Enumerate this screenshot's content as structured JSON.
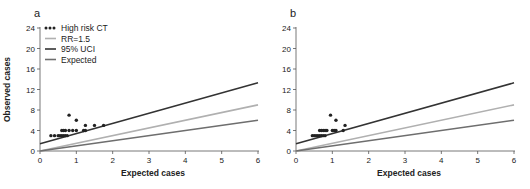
{
  "chart_data": [
    {
      "type": "scatter",
      "panel_label": "a",
      "title": "",
      "xlabel": "Expected cases",
      "ylabel": "Observed cases",
      "xlim": [
        0,
        6
      ],
      "ylim": [
        0,
        24
      ],
      "xticks": [
        0,
        1,
        2,
        3,
        4,
        5,
        6
      ],
      "yticks": [
        0,
        4,
        8,
        12,
        16,
        20,
        24
      ],
      "grid": false,
      "legend_position": "top-left",
      "legend": [
        {
          "label": "High risk CT",
          "style": "dots",
          "color": "#222222"
        },
        {
          "label": "RR=1.5",
          "style": "line",
          "color": "#b0b0b0"
        },
        {
          "label": "95% UCI",
          "style": "line",
          "color": "#333333"
        },
        {
          "label": "Expected",
          "style": "line",
          "color": "#6e6e6e"
        }
      ],
      "series": [
        {
          "name": "High risk CT",
          "type": "scatter",
          "color": "#222222",
          "points": [
            [
              0.3,
              3
            ],
            [
              0.4,
              3
            ],
            [
              0.5,
              3
            ],
            [
              0.55,
              3
            ],
            [
              0.6,
              3
            ],
            [
              0.65,
              3
            ],
            [
              0.7,
              3
            ],
            [
              0.75,
              3
            ],
            [
              0.6,
              4
            ],
            [
              0.65,
              4
            ],
            [
              0.7,
              4
            ],
            [
              0.8,
              4
            ],
            [
              0.9,
              4
            ],
            [
              1.0,
              4
            ],
            [
              1.2,
              4
            ],
            [
              1.25,
              4
            ],
            [
              1.25,
              5
            ],
            [
              1.5,
              5
            ],
            [
              1.75,
              5
            ],
            [
              1.0,
              6
            ],
            [
              0.8,
              7
            ]
          ]
        },
        {
          "name": "RR=1.5",
          "type": "line",
          "color": "#b0b0b0",
          "points": [
            [
              0,
              0
            ],
            [
              6,
              9
            ]
          ]
        },
        {
          "name": "95% UCI",
          "type": "line",
          "color": "#333333",
          "points": [
            [
              0,
              1.4
            ],
            [
              6,
              13.3
            ]
          ]
        },
        {
          "name": "Expected",
          "type": "line",
          "color": "#6e6e6e",
          "points": [
            [
              0,
              0
            ],
            [
              6,
              6
            ]
          ]
        }
      ]
    },
    {
      "type": "scatter",
      "panel_label": "b",
      "title": "",
      "xlabel": "Expected cases",
      "ylabel": "",
      "xlim": [
        0,
        6
      ],
      "ylim": [
        0,
        24
      ],
      "xticks": [
        0,
        1,
        2,
        3,
        4,
        5,
        6
      ],
      "yticks": [
        0,
        4,
        8,
        12,
        16,
        20,
        24
      ],
      "grid": false,
      "series": [
        {
          "name": "High risk CT",
          "type": "scatter",
          "color": "#222222",
          "points": [
            [
              0.45,
              3
            ],
            [
              0.5,
              3
            ],
            [
              0.55,
              3
            ],
            [
              0.6,
              3
            ],
            [
              0.65,
              3
            ],
            [
              0.7,
              3
            ],
            [
              0.75,
              3
            ],
            [
              0.8,
              3
            ],
            [
              0.65,
              4
            ],
            [
              0.7,
              4
            ],
            [
              0.75,
              4
            ],
            [
              0.8,
              4
            ],
            [
              0.85,
              4
            ],
            [
              1.0,
              4
            ],
            [
              1.05,
              4
            ],
            [
              1.1,
              4
            ],
            [
              1.3,
              4
            ],
            [
              1.35,
              5
            ],
            [
              1.1,
              6
            ],
            [
              0.95,
              7
            ]
          ]
        },
        {
          "name": "RR=1.5",
          "type": "line",
          "color": "#b0b0b0",
          "points": [
            [
              0,
              0
            ],
            [
              6,
              9
            ]
          ]
        },
        {
          "name": "95% UCI",
          "type": "line",
          "color": "#333333",
          "points": [
            [
              0,
              1.4
            ],
            [
              6,
              13.3
            ]
          ]
        },
        {
          "name": "Expected",
          "type": "line",
          "color": "#6e6e6e",
          "points": [
            [
              0,
              0
            ],
            [
              6,
              6
            ]
          ]
        }
      ]
    }
  ]
}
